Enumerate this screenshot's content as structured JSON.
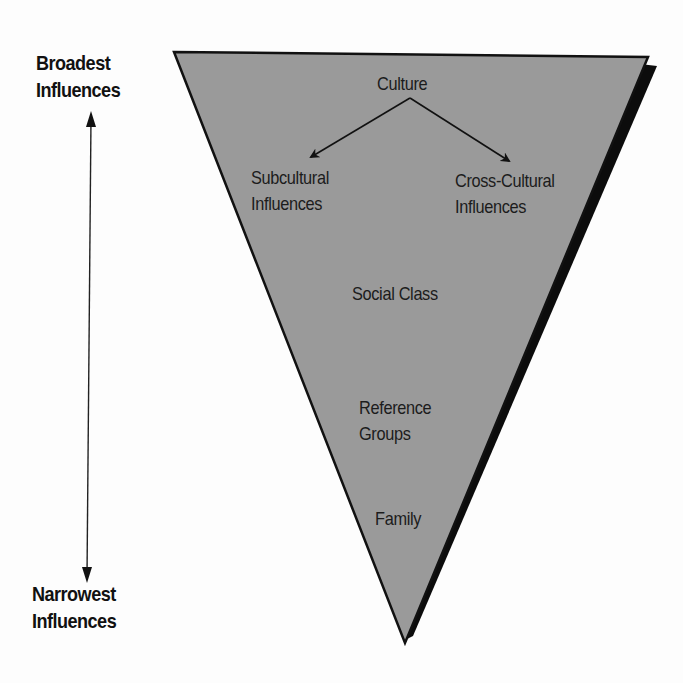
{
  "diagram": {
    "type": "inverted-triangle hierarchy",
    "colors": {
      "triangle_fill": "#9a9a9a",
      "triangle_outline": "#111111",
      "shadow": "#0c0c0c",
      "background": "#fdfdfd",
      "text": "#1a1a1a"
    },
    "scale_axis": {
      "top_label": [
        "Broadest",
        "Influences"
      ],
      "bottom_label": [
        "Narrowest",
        "Influences"
      ],
      "arrow": "double-headed vertical"
    },
    "levels": [
      {
        "id": "culture",
        "label": [
          "Culture"
        ]
      },
      {
        "id": "subcultural",
        "label": [
          "Subcultural",
          "Influences"
        ]
      },
      {
        "id": "cross-cultural",
        "label": [
          "Cross-Cultural",
          "Influences"
        ]
      },
      {
        "id": "social-class",
        "label": [
          "Social Class"
        ]
      },
      {
        "id": "reference-groups",
        "label": [
          "Reference",
          "Groups"
        ]
      },
      {
        "id": "family",
        "label": [
          "Family"
        ]
      }
    ],
    "connections": [
      {
        "from": "culture",
        "to": "subcultural"
      },
      {
        "from": "culture",
        "to": "cross-cultural"
      }
    ]
  }
}
